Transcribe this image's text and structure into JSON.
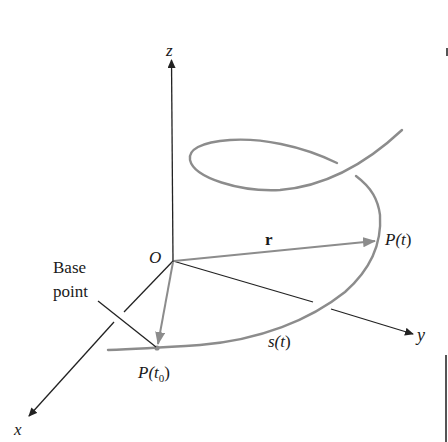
{
  "figure": {
    "type": "3D space curve with arc length parameter",
    "colors": {
      "axes": "#222222",
      "curve": "#8c8c8c",
      "vector": "#8c8c8c",
      "background": "#ffffff",
      "text": "#1a1a1a"
    },
    "axes": {
      "z_label": "z",
      "x_label": "x",
      "y_label": "y",
      "origin_label": "O"
    },
    "labels": {
      "vector_r": "r",
      "point_t": "P(t)",
      "point_t_prefix": "P(",
      "point_t_var": "t",
      "point_t_suffix": ")",
      "point_t0_prefix": "P(",
      "point_t0_var": "t",
      "point_t0_sub": "0",
      "point_t0_suffix": ")",
      "arc_length_prefix": "s(",
      "arc_length_var": "t",
      "arc_length_suffix": ")",
      "base_point_line1": "Base",
      "base_point_line2": "point"
    }
  }
}
